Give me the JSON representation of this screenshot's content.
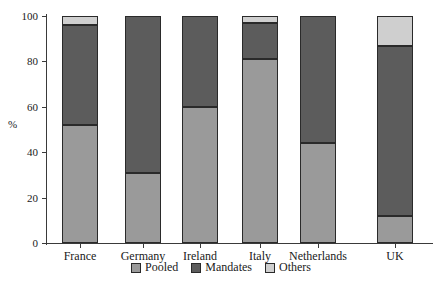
{
  "chart_data": {
    "type": "bar",
    "subtype": "stacked-100-percent",
    "title": "",
    "xlabel": "",
    "ylabel": "%",
    "ylim": [
      0,
      100
    ],
    "yticks": [
      0,
      20,
      40,
      60,
      80,
      100
    ],
    "ytick_labels": [
      "0",
      "20",
      "40",
      "60",
      "80",
      "100"
    ],
    "grid": false,
    "legend_position": "bottom-center",
    "categories": [
      "France",
      "Germany",
      "Ireland",
      "Italy",
      "Netherlands",
      "UK"
    ],
    "series": [
      {
        "name": "Pooled",
        "color": "#9a9a9a",
        "values": [
          52,
          31,
          60,
          81,
          44,
          12
        ]
      },
      {
        "name": "Mandates",
        "color": "#5c5c5c",
        "values": [
          44,
          69,
          40,
          16,
          56,
          75
        ]
      },
      {
        "name": "Others",
        "color": "#cfcfcf",
        "values": [
          4,
          0,
          0,
          3,
          0,
          13
        ]
      }
    ]
  },
  "legend": {
    "entries": [
      {
        "label": "Pooled"
      },
      {
        "label": "Mandates"
      },
      {
        "label": "Others"
      }
    ]
  },
  "axis": {
    "y_title": "%",
    "y_tick_labels": [
      "100",
      "80",
      "60",
      "40",
      "20",
      "0"
    ],
    "x_tick_labels": [
      "France",
      "Germany",
      "Ireland",
      "Italy",
      "Netherlands",
      "UK"
    ]
  }
}
